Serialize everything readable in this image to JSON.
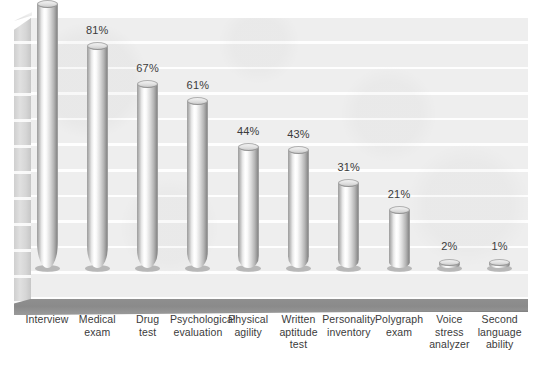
{
  "chart_data": {
    "type": "bar",
    "title": "",
    "subtitle": "",
    "xlabel": "",
    "ylabel": "",
    "ylim": [
      0,
      100
    ],
    "grid": true,
    "legend": "none",
    "style": "3d-cylinder",
    "value_suffix": "%",
    "categories": [
      "Interview",
      "Medical exam",
      "Drug test",
      "Psychological evaluation",
      "Physical agility",
      "Written aptitude test",
      "Personality inventory",
      "Polygraph exam",
      "Voice stress analyzer",
      "Second language ability"
    ],
    "values": [
      96,
      81,
      67,
      61,
      44,
      43,
      31,
      21,
      2,
      1
    ],
    "data_labels": [
      "96%",
      "81%",
      "67%",
      "61%",
      "44%",
      "43%",
      "31%",
      "21%",
      "2%",
      "1%"
    ],
    "category_lines": [
      [
        "Interview"
      ],
      [
        "Medical",
        "exam"
      ],
      [
        "Drug",
        "test"
      ],
      [
        "Psychological",
        "evaluation"
      ],
      [
        "Physical",
        "agility"
      ],
      [
        "Written",
        "aptitude",
        "test"
      ],
      [
        "Personality",
        "inventory"
      ],
      [
        "Polygraph",
        "exam"
      ],
      [
        "Voice stress",
        "analyzer"
      ],
      [
        "Second",
        "language",
        "ability"
      ]
    ]
  },
  "colors": {
    "background": "#ffffff",
    "plot_wall": "#eeeeee",
    "gridline": "#ffffff",
    "floor": "#8a8a8a",
    "side_wall": "#d6d6d6",
    "bar_light": "#ffffff",
    "bar_dark": "#8e8e8e",
    "label_text": "#3b3b3b"
  }
}
